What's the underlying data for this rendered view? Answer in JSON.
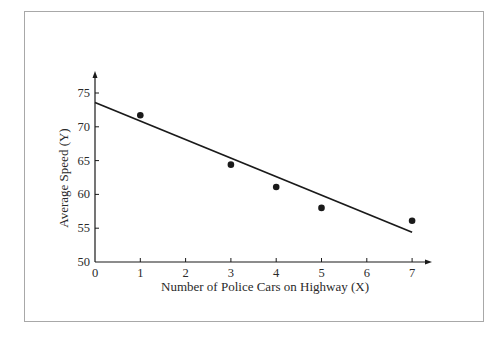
{
  "chart_data": {
    "type": "scatter",
    "title": "",
    "xlabel": "Number of Police Cars on Highway (X)",
    "ylabel": "Average Speed (Y)",
    "xlim": [
      0,
      7
    ],
    "ylim": [
      50,
      75
    ],
    "x_ticks": [
      0,
      1,
      2,
      3,
      4,
      5,
      6,
      7
    ],
    "y_ticks": [
      50,
      55,
      60,
      65,
      70,
      75
    ],
    "grid": false,
    "legend": "none",
    "series": [
      {
        "name": "Observations",
        "type": "scatter",
        "x": [
          1,
          3,
          4,
          5,
          7
        ],
        "y": [
          71.7,
          64.4,
          61.1,
          58.0,
          56.1
        ]
      },
      {
        "name": "Regression line",
        "type": "line",
        "x": [
          0,
          7
        ],
        "y": [
          73.6,
          54.4
        ]
      }
    ],
    "colors": {
      "ink": "#1a1a1a",
      "frame": "#a8a8a8"
    }
  }
}
